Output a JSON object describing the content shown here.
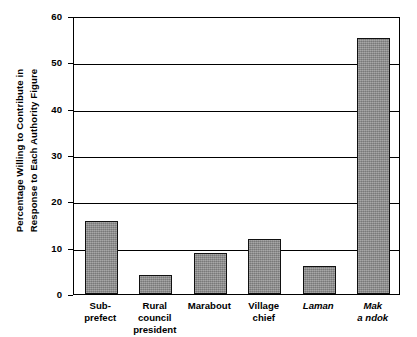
{
  "chart_data": {
    "type": "bar",
    "title": "",
    "xlabel": "",
    "ylabel": "Percentage Willing to Contribute in Response to Each Authority Figure",
    "ylabel_lines": [
      "Percentage Willing to Contribute in",
      "Response to Each Authority Figure"
    ],
    "categories": [
      "Sub-prefect",
      "Rural council president",
      "Marabout",
      "Village chief",
      "Laman",
      "Mak a ndok"
    ],
    "category_lines": [
      [
        "Sub-",
        "prefect"
      ],
      [
        "Rural council",
        "president"
      ],
      [
        "Marabout"
      ],
      [
        "Village",
        "chief"
      ],
      [
        "Laman"
      ],
      [
        "Mak",
        "a ndok"
      ]
    ],
    "category_italic": [
      false,
      false,
      false,
      false,
      true,
      true
    ],
    "values": [
      15.8,
      4.2,
      8.8,
      11.8,
      6.0,
      55.2
    ],
    "ylim": [
      0,
      60
    ],
    "yticks": [
      0,
      10,
      20,
      30,
      40,
      50,
      60
    ],
    "ytick_labels": [
      "0",
      "10",
      "20",
      "30",
      "40",
      "50",
      "60"
    ],
    "grid": true,
    "grid_axis": "y",
    "legend": "none",
    "bar_color": "#8f8f8f",
    "bar_edge_color": "#111111",
    "axis_color": "#000000"
  }
}
